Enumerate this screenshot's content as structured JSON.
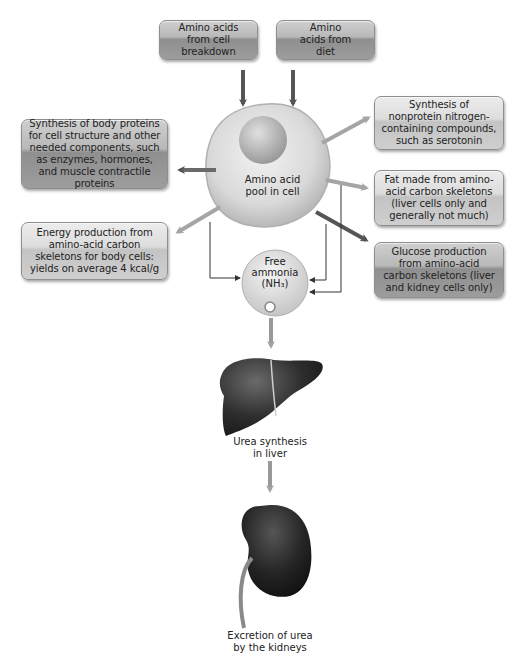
{
  "diagram": {
    "sources": [
      {
        "id": "cell-breakdown",
        "label": "Amino acids from cell breakdown"
      },
      {
        "id": "diet",
        "label": "Amino acids from diet"
      }
    ],
    "pool": {
      "label_line1": "Amino acid",
      "label_line2": "pool in cell"
    },
    "outputs": [
      {
        "id": "body-proteins",
        "label": "Synthesis of body proteins for cell structure and other needed components, such as enzymes, hormones, and muscle contractile proteins"
      },
      {
        "id": "nonprotein-nitrogen",
        "label": "Synthesis of nonprotein nitrogen-containing compounds, such as serotonin"
      },
      {
        "id": "fat",
        "label": "Fat made from amino-acid carbon skeletons (liver cells only and generally not much)"
      },
      {
        "id": "energy",
        "label": "Energy production from amino-acid carbon skeletons for body cells: yields on average 4 kcal/g"
      },
      {
        "id": "glucose",
        "label": "Glucose production from amino-acid carbon skeletons (liver and kidney cells only)"
      }
    ],
    "ammonia": {
      "line1": "Free",
      "line2": "ammonia",
      "line3": "(NH₃)"
    },
    "liver": {
      "line1": "Urea synthesis",
      "line2": "in liver"
    },
    "kidney": {
      "line1": "Excretion of urea",
      "line2": "by the kidneys"
    }
  },
  "colors": {
    "arrow_dark": "#5a5a5a",
    "arrow_light": "#a8a8a8",
    "box_dark": "#9d9d9d",
    "box_light": "#d4d4d4",
    "organ": "#2b2b2b"
  }
}
